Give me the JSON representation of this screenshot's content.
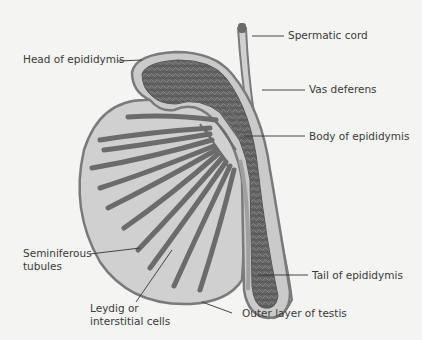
{
  "diagram": {
    "colors": {
      "background": "#f4f4f3",
      "capsule_fill": "#cfd0cf",
      "capsule_stroke": "#7a7a7a",
      "tubule": "#6b6b6b",
      "tubule_dark": "#555555",
      "leader_line": "#333333",
      "text": "#3a3a3a"
    },
    "labels": {
      "spermatic_cord": "Spermatic cord",
      "head_of_epididymis": "Head of epididymis",
      "vas_deferens": "Vas deferens",
      "body_of_epididymis": "Body of epididymis",
      "seminiferous_line1": "Seminiferous",
      "seminiferous_line2": "tubules",
      "leydig_line1": "Leydig or",
      "leydig_line2": "interstitial cells",
      "tail_of_epididymis": "Tail of epididymis",
      "outer_layer": "Outer layer of testis"
    }
  }
}
